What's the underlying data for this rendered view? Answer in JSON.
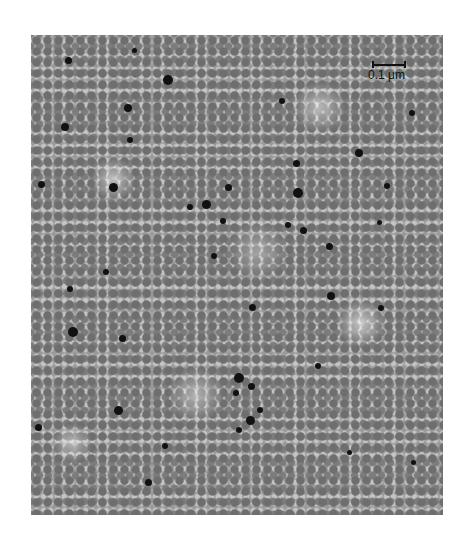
{
  "figure": {
    "type": "electron micrograph",
    "scale_bar": {
      "label": "0.1 μm"
    },
    "colors": {
      "background": "#ffffff",
      "particles": "#111111",
      "field": "#9a9a9a"
    },
    "dots": [
      [
        68,
        60,
        7
      ],
      [
        168,
        80,
        10
      ],
      [
        128,
        108,
        8
      ],
      [
        130,
        140,
        6
      ],
      [
        65,
        127,
        8
      ],
      [
        41,
        184,
        7
      ],
      [
        113,
        187,
        9
      ],
      [
        190,
        207,
        6
      ],
      [
        206,
        204,
        9
      ],
      [
        228,
        187,
        7
      ],
      [
        223,
        221,
        6
      ],
      [
        296,
        163,
        7
      ],
      [
        298,
        193,
        10
      ],
      [
        288,
        225,
        6
      ],
      [
        303,
        230,
        7
      ],
      [
        329,
        246,
        7
      ],
      [
        359,
        153,
        8
      ],
      [
        379,
        222,
        5
      ],
      [
        387,
        186,
        6
      ],
      [
        412,
        113,
        6
      ],
      [
        282,
        101,
        6
      ],
      [
        331,
        296,
        8
      ],
      [
        252,
        307,
        7
      ],
      [
        106,
        272,
        6
      ],
      [
        70,
        289,
        6
      ],
      [
        73,
        332,
        10
      ],
      [
        122,
        338,
        7
      ],
      [
        318,
        366,
        6
      ],
      [
        239,
        378,
        10
      ],
      [
        251,
        386,
        7
      ],
      [
        236,
        393,
        6
      ],
      [
        250,
        420,
        9
      ],
      [
        260,
        410,
        6
      ],
      [
        239,
        430,
        6
      ],
      [
        118,
        410,
        9
      ],
      [
        38,
        427,
        7
      ],
      [
        165,
        446,
        6
      ],
      [
        148,
        482,
        7
      ],
      [
        349,
        452,
        5
      ],
      [
        413,
        462,
        5
      ],
      [
        381,
        308,
        6
      ],
      [
        214,
        256,
        6
      ],
      [
        134,
        50,
        5
      ]
    ]
  }
}
